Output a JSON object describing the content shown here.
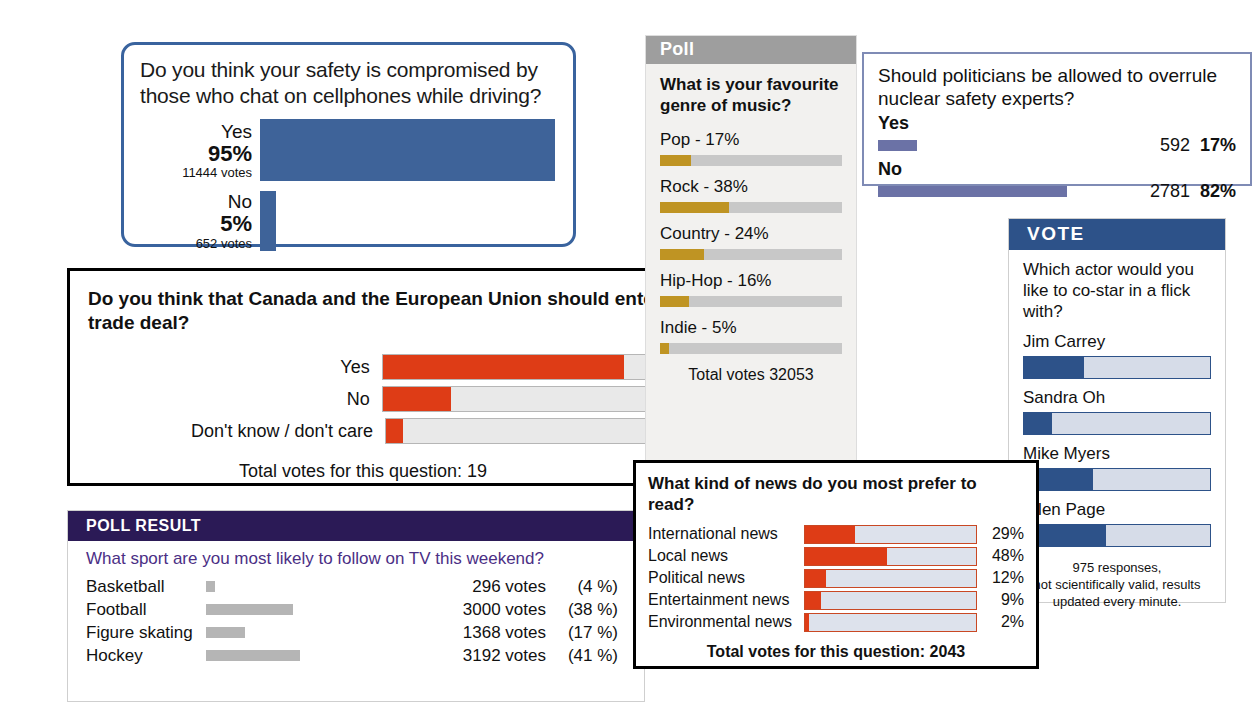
{
  "colors": {
    "blue_bar": "#3e6399",
    "red_bar": "#de3c16",
    "gold_bar": "#bf9423",
    "slate_bar": "#6b72a6",
    "purple_header": "#2b1a56",
    "vote_header": "#2d5289",
    "gray_header": "#9e9e9e",
    "gray_bar": "#b5b5b5"
  },
  "cellphone": {
    "question": "Do you think your safety is compromised by those who chat on cellphones while driving?",
    "options": [
      {
        "label": "Yes",
        "percent_text": "95%",
        "percent": 95,
        "votes_text": "11444 votes"
      },
      {
        "label": "No",
        "percent_text": "5%",
        "percent": 5,
        "votes_text": "652 votes"
      }
    ]
  },
  "canada": {
    "question": "Do you think that Canada and the European Union should enter a free-trade deal?",
    "options": [
      {
        "label": "Yes",
        "percent_text": "74%",
        "percent": 74
      },
      {
        "label": "No",
        "percent_text": "21%",
        "percent": 21
      },
      {
        "label": "Don't know / don't care",
        "percent_text": "5%",
        "percent": 5
      }
    ],
    "total": "Total votes for this question: 19"
  },
  "poll_result": {
    "header": "POLL RESULT",
    "question": "What sport are you most likely to follow on TV this weekend?",
    "rows": [
      {
        "name": "Basketball",
        "votes": "296 votes",
        "percent_text": "(4 %)",
        "percent": 4
      },
      {
        "name": "Football",
        "votes": "3000 votes",
        "percent_text": "(38 %)",
        "percent": 38
      },
      {
        "name": "Figure skating",
        "votes": "1368 votes",
        "percent_text": "(17 %)",
        "percent": 17
      },
      {
        "name": "Hockey",
        "votes": "3192 votes",
        "percent_text": "(41 %)",
        "percent": 41
      }
    ]
  },
  "music": {
    "header": "Poll",
    "question": "What is your favourite genre of music?",
    "options": [
      {
        "label": "Pop - 17%",
        "percent": 17
      },
      {
        "label": "Rock - 38%",
        "percent": 38
      },
      {
        "label": "Country - 24%",
        "percent": 24
      },
      {
        "label": "Hip-Hop - 16%",
        "percent": 16
      },
      {
        "label": "Indie - 5%",
        "percent": 5
      }
    ],
    "total": "Total votes 32053"
  },
  "nuclear": {
    "question": "Should politicians be allowed to overrule nuclear safety experts?",
    "options": [
      {
        "label": "Yes",
        "votes": "592",
        "percent_text": "17%",
        "percent": 17
      },
      {
        "label": "No",
        "votes": "2781",
        "percent_text": "82%",
        "percent": 82
      }
    ]
  },
  "vote": {
    "header": "VOTE",
    "question": "Which actor would you like to co-star in a flick with?",
    "options": [
      {
        "label": "Jim Carrey",
        "percent": 32
      },
      {
        "label": "Sandra Oh",
        "percent": 15
      },
      {
        "label": "Mike Myers",
        "percent": 37
      },
      {
        "label": "Ellen Page",
        "percent": 44
      }
    ],
    "note": "975 responses,\nnot scientifically valid, results\nupdated every minute."
  },
  "news": {
    "question": "What kind of news do you most prefer to read?",
    "options": [
      {
        "label": "International news",
        "percent_text": "29%",
        "percent": 29
      },
      {
        "label": "Local news",
        "percent_text": "48%",
        "percent": 48
      },
      {
        "label": "Political news",
        "percent_text": "12%",
        "percent": 12
      },
      {
        "label": "Entertainment news",
        "percent_text": "9%",
        "percent": 9
      },
      {
        "label": "Environmental news",
        "percent_text": "2%",
        "percent": 2
      }
    ],
    "total": "Total votes for this question: 2043"
  },
  "chart_data": [
    {
      "type": "bar",
      "title": "Do you think your safety is compromised by those who chat on cellphones while driving?",
      "categories": [
        "Yes",
        "No"
      ],
      "values": [
        95,
        5
      ],
      "votes": [
        11444,
        652
      ],
      "ylabel": "percent",
      "xlabel": "",
      "ylim": [
        0,
        100
      ]
    },
    {
      "type": "bar",
      "title": "Do you think that Canada and the European Union should enter a free-trade deal?",
      "categories": [
        "Yes",
        "No",
        "Don't know / don't care"
      ],
      "values": [
        74,
        21,
        5
      ],
      "annotation": "Total votes for this question: 19",
      "ylim": [
        0,
        100
      ]
    },
    {
      "type": "bar",
      "title": "What sport are you most likely to follow on TV this weekend?",
      "categories": [
        "Basketball",
        "Football",
        "Figure skating",
        "Hockey"
      ],
      "values": [
        4,
        38,
        17,
        41
      ],
      "votes": [
        296,
        3000,
        1368,
        3192
      ],
      "ylim": [
        0,
        100
      ]
    },
    {
      "type": "bar",
      "title": "What is your favourite genre of music?",
      "categories": [
        "Pop",
        "Rock",
        "Country",
        "Hip-Hop",
        "Indie"
      ],
      "values": [
        17,
        38,
        24,
        16,
        5
      ],
      "annotation": "Total votes 32053",
      "ylim": [
        0,
        100
      ]
    },
    {
      "type": "bar",
      "title": "Should politicians be allowed to overrule nuclear safety experts?",
      "categories": [
        "Yes",
        "No"
      ],
      "values": [
        17,
        82
      ],
      "votes": [
        592,
        2781
      ],
      "ylim": [
        0,
        100
      ]
    },
    {
      "type": "bar",
      "title": "Which actor would you like to co-star in a flick with?",
      "categories": [
        "Jim Carrey",
        "Sandra Oh",
        "Mike Myers",
        "Ellen Page"
      ],
      "values": [
        32,
        15,
        37,
        44
      ],
      "annotation": "975 responses, not scientifically valid, results updated every minute.",
      "ylim": [
        0,
        100
      ]
    },
    {
      "type": "bar",
      "title": "What kind of news do you most prefer to read?",
      "categories": [
        "International news",
        "Local news",
        "Political news",
        "Entertainment news",
        "Environmental news"
      ],
      "values": [
        29,
        48,
        12,
        9,
        2
      ],
      "annotation": "Total votes for this question: 2043",
      "ylim": [
        0,
        100
      ]
    }
  ]
}
